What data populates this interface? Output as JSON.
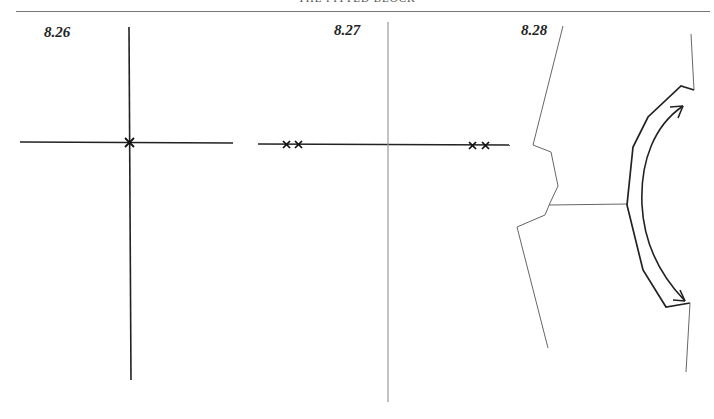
{
  "page": {
    "running_head": "THE FITTED BLOCK"
  },
  "figures": [
    {
      "label": "8.26",
      "description": "Axes with single cross at origin"
    },
    {
      "label": "8.27",
      "description": "Axes with two pairs of crosses on horizontal axis"
    },
    {
      "label": "8.28",
      "description": "Block outline with curved double-headed arrow"
    }
  ],
  "colors": {
    "line": "#222222",
    "thin_line": "#666666",
    "rule": "#777777"
  }
}
